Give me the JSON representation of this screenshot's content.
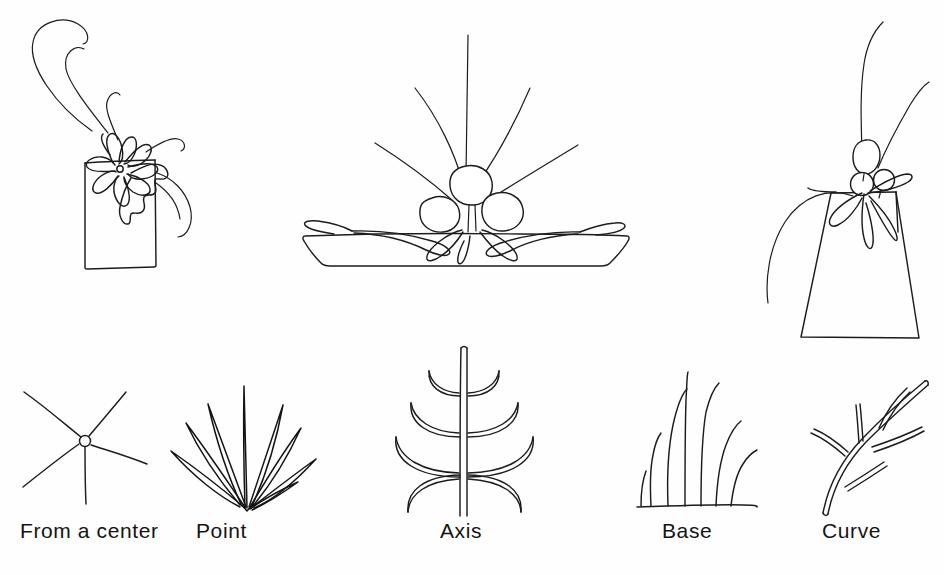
{
  "page": {
    "background_color": "#fefefe",
    "ink_color": "#1c1c1c",
    "width": 944,
    "height": 575,
    "kind": "hand-drawn-line-illustration-plate"
  },
  "top_row": {
    "figures": [
      {
        "id": "rectangular-vase-arrangement",
        "description": "Daisy-like flower with radiating petals resting on the rim of a tall rectangular vase, with long arcing stems sweeping up and to the left",
        "container": "rectangular vase",
        "flower_count": 1,
        "stem_count": 4
      },
      {
        "id": "shallow-dish-arrangement",
        "description": "Three rounded blossom heads clustered on a flat shallow dish, with tall stems radiating upward and pointed leaves lying outward along the dish",
        "container": "shallow flat dish",
        "flower_count": 3,
        "stem_count": 5
      },
      {
        "id": "trapezoid-vase-arrangement",
        "description": "Three rounded blossom heads at the neck of a tapered trapezoidal vase with two tall curving stems and drooping leaves",
        "container": "trapezoidal vase",
        "flower_count": 3,
        "stem_count": 2
      }
    ]
  },
  "bottom_row": {
    "principles": [
      {
        "label": "From a center",
        "id": "from-a-center",
        "diagram": "five straight lines radiating outward from a small open circle",
        "line_count": 5
      },
      {
        "label": "Point",
        "id": "point",
        "diagram": "narrow spear-shaped blades fanning upward from one converging point",
        "line_count": 8
      },
      {
        "label": "Axis",
        "id": "axis",
        "diagram": "vertical central stem crossed by four pairs of curved branches widening toward the base",
        "line_count": 4
      },
      {
        "label": "Base",
        "id": "base",
        "diagram": "seven stems of varied height rising and splaying from a horizontal ground line",
        "line_count": 7
      },
      {
        "label": "Curve",
        "id": "curve",
        "diagram": "a sweeping curved branch bearing several slender leaf offshoots",
        "line_count": 4
      }
    ]
  }
}
